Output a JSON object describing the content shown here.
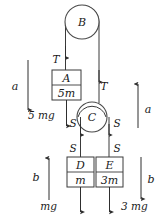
{
  "figure": {
    "background_color": "#ffffff",
    "line_color": "#3a3a3a",
    "text_color": "#1a1a1a"
  },
  "pulleys": [
    {
      "name": "pulley-b",
      "label": "B",
      "cx": 82,
      "cy": 22,
      "r": 17
    },
    {
      "name": "pulley-c",
      "label": "C",
      "cx": 92,
      "cy": 117,
      "r": 15
    }
  ],
  "blocks": [
    {
      "name": "block-a",
      "label": "A",
      "mass": "5m",
      "x": 52,
      "y": 70,
      "w": 29,
      "h": 30
    },
    {
      "name": "block-d",
      "label": "D",
      "mass": "m",
      "x": 67,
      "y": 157,
      "w": 27,
      "h": 30
    },
    {
      "name": "block-e",
      "label": "E",
      "mass": "3m",
      "x": 96,
      "y": 157,
      "w": 27,
      "h": 30
    }
  ],
  "tensions": [
    {
      "name": "tension-left",
      "label": "T",
      "x": 56,
      "y": 63
    },
    {
      "name": "tension-right",
      "label": "T",
      "x": 103,
      "y": 87
    },
    {
      "name": "tension-s-c-left",
      "label": "S",
      "x": 72,
      "y": 124
    },
    {
      "name": "tension-s-c-right",
      "label": "S",
      "x": 115,
      "y": 124
    },
    {
      "name": "tension-s-d",
      "label": "S",
      "x": 72,
      "y": 150
    },
    {
      "name": "tension-s-e",
      "label": "S",
      "x": 115,
      "y": 150
    }
  ],
  "weights": [
    {
      "name": "weight-a",
      "label": "5 mg",
      "x": 28,
      "y": 119
    },
    {
      "name": "weight-d",
      "label": "mg",
      "x": 57,
      "y": 210
    },
    {
      "name": "weight-e",
      "label": "3 mg",
      "x": 121,
      "y": 210
    }
  ],
  "accelerations": [
    {
      "name": "accel-a-left",
      "label": "a",
      "label_x": 13,
      "label_y": 89,
      "arrow_x": 28,
      "y_start": 60,
      "y_end": 110,
      "direction": "down"
    },
    {
      "name": "accel-a-right",
      "label": "a",
      "label_x": 147,
      "label_y": 113,
      "arrow_x": 138,
      "y_start": 128,
      "y_end": 84,
      "direction": "up"
    },
    {
      "name": "accel-b-left",
      "label": "b",
      "label_x": 34,
      "label_y": 180,
      "arrow_x": 49,
      "y_start": 200,
      "y_end": 158,
      "direction": "up"
    },
    {
      "name": "accel-b-right",
      "label": "b",
      "label_x": 150,
      "label_y": 182,
      "arrow_x": 141,
      "y_start": 157,
      "y_end": 199,
      "direction": "down"
    }
  ]
}
